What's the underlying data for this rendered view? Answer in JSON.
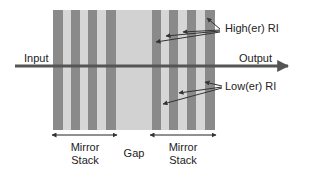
{
  "diagram": {
    "colors": {
      "dark_layer": "#8a8a8a",
      "light_layer": "#d6d6d6",
      "gap": "#d2d2d2",
      "arrow": "#555555",
      "text": "#222222"
    },
    "labels": {
      "input": "Input",
      "output": "Output",
      "higher_ri": "High(er) RI",
      "lower_ri": "Low(er) RI",
      "gap": "Gap",
      "mirror_stack_left_line1": "Mirror",
      "mirror_stack_left_line2": "Stack",
      "mirror_stack_right_line1": "Mirror",
      "mirror_stack_right_line2": "Stack"
    },
    "layers": [
      {
        "region": "left-stack",
        "type": "dark",
        "x": 53,
        "w": 10
      },
      {
        "region": "left-stack",
        "type": "light",
        "x": 63,
        "w": 8
      },
      {
        "region": "left-stack",
        "type": "dark",
        "x": 71,
        "w": 9
      },
      {
        "region": "left-stack",
        "type": "light",
        "x": 80,
        "w": 8
      },
      {
        "region": "left-stack",
        "type": "dark",
        "x": 88,
        "w": 9
      },
      {
        "region": "left-stack",
        "type": "light",
        "x": 97,
        "w": 9
      },
      {
        "region": "left-stack",
        "type": "dark",
        "x": 106,
        "w": 10
      },
      {
        "region": "gap",
        "type": "gap",
        "x": 116,
        "w": 36
      },
      {
        "region": "right-stack",
        "type": "dark",
        "x": 152,
        "w": 9
      },
      {
        "region": "right-stack",
        "type": "light",
        "x": 161,
        "w": 8
      },
      {
        "region": "right-stack",
        "type": "dark",
        "x": 169,
        "w": 9
      },
      {
        "region": "right-stack",
        "type": "light",
        "x": 178,
        "w": 9
      },
      {
        "region": "right-stack",
        "type": "dark",
        "x": 187,
        "w": 9
      },
      {
        "region": "right-stack",
        "type": "light",
        "x": 196,
        "w": 9
      },
      {
        "region": "right-stack",
        "type": "dark",
        "x": 205,
        "w": 10
      }
    ]
  }
}
